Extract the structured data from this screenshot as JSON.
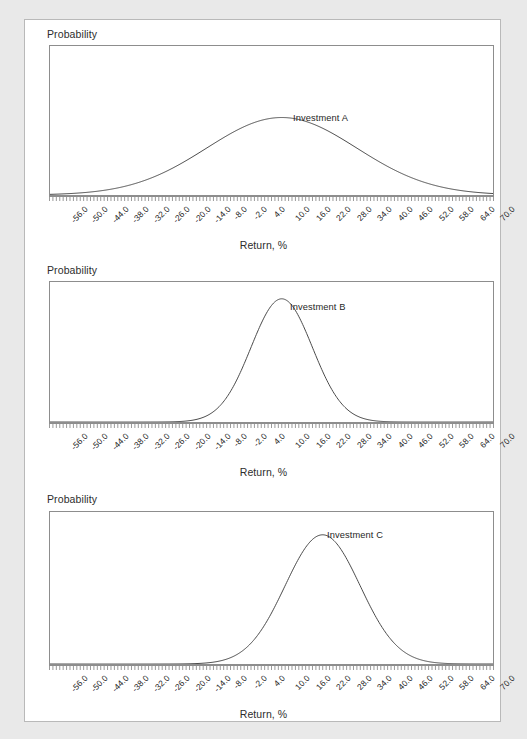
{
  "figure": {
    "background_color": "#e9e9e9",
    "card_color": "#ffffff",
    "axis_color": "#8d8d8d",
    "curve_color": "#4a4a4a",
    "text_color": "#2d2d2d"
  },
  "labels": {
    "y_axis_title": "Probability",
    "x_axis_title": "Return, %"
  },
  "panels": [
    {
      "y_axis_title": "Probability",
      "x_axis_title": "Return, %",
      "series_label": "Investment A"
    },
    {
      "y_axis_title": "Probability",
      "x_axis_title": "Return, %",
      "series_label": "Investment B"
    },
    {
      "y_axis_title": "Probability",
      "x_axis_title": "Return, %",
      "series_label": "Investment C"
    }
  ],
  "chart_data": [
    {
      "type": "line",
      "title": "Investment A",
      "xlabel": "Return, %",
      "ylabel": "Probability",
      "grid": false,
      "legend": "inline-annotation",
      "xlim": [
        -58.0,
        72.0
      ],
      "ylim": [
        0,
        1
      ],
      "xticks": [
        "-56.0",
        "-50.0",
        "-44.0",
        "-38.0",
        "-32.0",
        "-26.0",
        "-20.0",
        "-14.0",
        "-8.0",
        "-2.0",
        "4.0",
        "10.0",
        "16.0",
        "22.0",
        "28.0",
        "34.0",
        "40.0",
        "46.0",
        "52.0",
        "58.0",
        "64.0",
        "70.0"
      ],
      "xtick_values": [
        -56.0,
        -50.0,
        -44.0,
        -38.0,
        -32.0,
        -26.0,
        -20.0,
        -14.0,
        -8.0,
        -2.0,
        4.0,
        10.0,
        16.0,
        22.0,
        28.0,
        34.0,
        40.0,
        46.0,
        52.0,
        58.0,
        64.0,
        70.0
      ],
      "yticks": [],
      "distribution": {
        "shape": "normal",
        "mean": 10.0,
        "std_dev": 22.0,
        "peak_height_rel": 0.52
      },
      "series": [
        {
          "name": "Investment A",
          "mean": 10.0,
          "std_dev": 22.0
        }
      ]
    },
    {
      "type": "line",
      "title": "Investment B",
      "xlabel": "Return, %",
      "ylabel": "Probability",
      "grid": false,
      "legend": "inline-annotation",
      "xlim": [
        -58.0,
        72.0
      ],
      "ylim": [
        0,
        1
      ],
      "xticks": [
        "-56.0",
        "-50.0",
        "-44.0",
        "-38.0",
        "-32.0",
        "-26.0",
        "-20.0",
        "-14.0",
        "-8.0",
        "-2.0",
        "4.0",
        "10.0",
        "16.0",
        "22.0",
        "28.0",
        "34.0",
        "40.0",
        "46.0",
        "52.0",
        "58.0",
        "64.0",
        "70.0"
      ],
      "xtick_values": [
        -56.0,
        -50.0,
        -44.0,
        -38.0,
        -32.0,
        -26.0,
        -20.0,
        -14.0,
        -8.0,
        -2.0,
        4.0,
        10.0,
        16.0,
        22.0,
        28.0,
        34.0,
        40.0,
        46.0,
        52.0,
        58.0,
        64.0,
        70.0
      ],
      "yticks": [],
      "distribution": {
        "shape": "normal",
        "mean": 10.0,
        "std_dev": 9.0,
        "peak_height_rel": 0.88
      },
      "series": [
        {
          "name": "Investment B",
          "mean": 10.0,
          "std_dev": 9.0
        }
      ]
    },
    {
      "type": "line",
      "title": "Investment C",
      "xlabel": "Return, %",
      "ylabel": "Probability",
      "grid": false,
      "legend": "inline-annotation",
      "xlim": [
        -58.0,
        72.0
      ],
      "ylim": [
        0,
        1
      ],
      "xticks": [
        "-56.0",
        "-50.0",
        "-44.0",
        "-38.0",
        "-32.0",
        "-26.0",
        "-20.0",
        "-14.0",
        "-8.0",
        "-2.0",
        "4.0",
        "10.0",
        "16.0",
        "22.0",
        "28.0",
        "34.0",
        "40.0",
        "46.0",
        "52.0",
        "58.0",
        "64.0",
        "70.0"
      ],
      "xtick_values": [
        -56.0,
        -50.0,
        -44.0,
        -38.0,
        -32.0,
        -26.0,
        -20.0,
        -14.0,
        -8.0,
        -2.0,
        4.0,
        10.0,
        16.0,
        22.0,
        28.0,
        34.0,
        40.0,
        46.0,
        52.0,
        58.0,
        64.0,
        70.0
      ],
      "yticks": [],
      "distribution": {
        "shape": "normal",
        "mean": 22.0,
        "std_dev": 11.0,
        "peak_height_rel": 0.85
      },
      "series": [
        {
          "name": "Investment C",
          "mean": 22.0,
          "std_dev": 11.0
        }
      ]
    }
  ]
}
